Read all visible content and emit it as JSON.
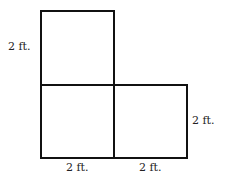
{
  "diagram": {
    "labels": {
      "left_side": "2 ft.",
      "right_side": "2 ft.",
      "bottom_left": "2 ft.",
      "bottom_right": "2 ft."
    },
    "squares": [
      {
        "position": "top-left",
        "side_ft": 2
      },
      {
        "position": "bottom-left",
        "side_ft": 2
      },
      {
        "position": "bottom-right",
        "side_ft": 2
      }
    ],
    "colors": {
      "stroke": "#111111",
      "background": "#ffffff"
    }
  }
}
